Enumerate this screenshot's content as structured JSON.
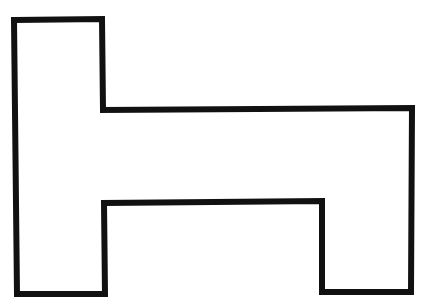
{
  "diagram": {
    "shape": "rectilinear-polygon",
    "stroke_color": "#111111",
    "fill_color": "#ffffff",
    "stroke_width": 6,
    "points": [
      [
        14,
        20
      ],
      [
        102,
        19
      ],
      [
        103,
        110
      ],
      [
        412,
        108
      ],
      [
        411,
        292
      ],
      [
        322,
        292
      ],
      [
        322,
        201
      ],
      [
        104,
        203
      ],
      [
        105,
        294
      ],
      [
        17,
        294
      ]
    ]
  }
}
